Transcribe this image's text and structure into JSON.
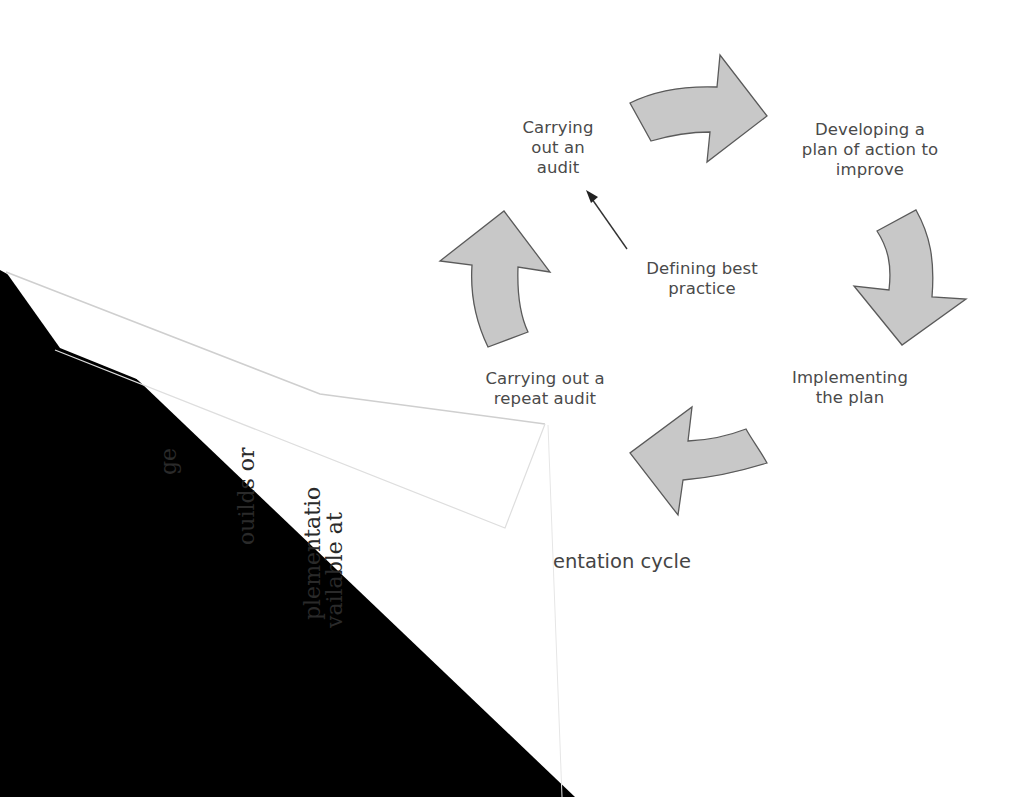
{
  "diagram": {
    "title_fragment": "entation cycle",
    "nodes": [
      {
        "id": "audit",
        "label": "Carrying\nout an\naudit"
      },
      {
        "id": "plan",
        "label": "Developing a\nplan of action to\nimprove"
      },
      {
        "id": "implement",
        "label": "Implementing\nthe plan"
      },
      {
        "id": "repeat",
        "label": "Carrying out a\nrepeat audit"
      },
      {
        "id": "best-practice",
        "label": "Defining best\npractice"
      }
    ],
    "edges": [
      {
        "from": "audit",
        "to": "plan",
        "style": "block-arrow"
      },
      {
        "from": "plan",
        "to": "implement",
        "style": "block-arrow"
      },
      {
        "from": "implement",
        "to": "repeat",
        "style": "block-arrow"
      },
      {
        "from": "repeat",
        "to": "audit",
        "style": "block-arrow"
      },
      {
        "from": "best-practice",
        "to": "audit",
        "style": "line-arrow"
      }
    ],
    "colors": {
      "arrow_fill": "#c8c8c8",
      "arrow_stroke": "#5a5a5a",
      "text": "#4a4a4a",
      "shadow": "#000000"
    }
  },
  "folded_page": {
    "text_fragments": [
      "ge",
      "ouilds or",
      "plementatio",
      "vailable at"
    ]
  }
}
